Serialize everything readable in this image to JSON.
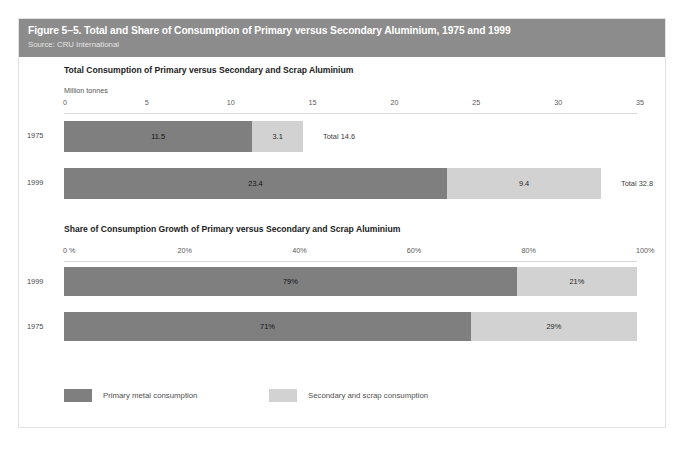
{
  "figure": {
    "title": "Figure 5–5. Total and Share of Consumption of Primary versus Secondary Aluminium, 1975 and 1999",
    "source": "Source: CRU International"
  },
  "colors": {
    "banner": "#8c8c8c",
    "primary": "#7f7f7f",
    "secondary": "#d2d2d2",
    "frame_border": "#e2e2e2"
  },
  "legend": {
    "items": [
      {
        "label": "Primary metal consumption",
        "color": "#7f7f7f",
        "left_px": 0
      },
      {
        "label": "Secondary and scrap consumption",
        "color": "#d2d2d2",
        "left_px": 205
      }
    ]
  },
  "chart_data": [
    {
      "id": "total-consumption",
      "type": "bar",
      "orientation": "horizontal",
      "stacked": true,
      "title": "Total Consumption of Primary versus Secondary and Scrap Aluminium",
      "xlabel": "Million tonnes",
      "ylabel": "",
      "xlim": [
        0,
        35
      ],
      "grid": false,
      "legend_position": "bottom",
      "ticks": [
        "0",
        "5",
        "10",
        "15",
        "20",
        "25",
        "30",
        "35"
      ],
      "tick_values": [
        0,
        5,
        10,
        15,
        20,
        25,
        30,
        35
      ],
      "categories": [
        "1975",
        "1999"
      ],
      "series": [
        {
          "name": "Primary metal consumption",
          "values": [
            11.5,
            23.4
          ]
        },
        {
          "name": "Secondary and scrap consumption",
          "values": [
            3.1,
            9.4
          ]
        }
      ],
      "rows": [
        {
          "label": "1975",
          "primary_value": 11.5,
          "primary_label": "11.5",
          "secondary_value": 3.1,
          "secondary_label": "3.1",
          "total_label": "Total 14.6",
          "total_value": 14.6
        },
        {
          "label": "1999",
          "primary_value": 23.4,
          "primary_label": "23.4",
          "secondary_value": 9.4,
          "secondary_label": "9.4",
          "total_label": "Total 32.8",
          "total_value": 32.8
        }
      ]
    },
    {
      "id": "share-of-growth",
      "type": "bar",
      "orientation": "horizontal",
      "stacked": true,
      "title": "Share of Consumption Growth of Primary versus Secondary and Scrap Aluminium",
      "xlabel": "",
      "ylabel": "",
      "xlim": [
        0,
        100
      ],
      "grid": false,
      "legend_position": "bottom",
      "ticks": [
        "0 %",
        "20%",
        "40%",
        "60%",
        "80%",
        "100%"
      ],
      "tick_values": [
        0,
        20,
        40,
        60,
        80,
        100
      ],
      "categories": [
        "1999",
        "1975"
      ],
      "series": [
        {
          "name": "Primary metal consumption",
          "values": [
            79,
            71
          ]
        },
        {
          "name": "Secondary and scrap consumption",
          "values": [
            21,
            29
          ]
        }
      ],
      "rows": [
        {
          "label": "1999",
          "primary_value": 79,
          "primary_label": "79%",
          "secondary_value": 21,
          "secondary_label": "21%",
          "total_label": "",
          "total_value": 100
        },
        {
          "label": "1975",
          "primary_value": 71,
          "primary_label": "71%",
          "secondary_value": 29,
          "secondary_label": "29%",
          "total_label": "",
          "total_value": 100
        }
      ]
    }
  ]
}
